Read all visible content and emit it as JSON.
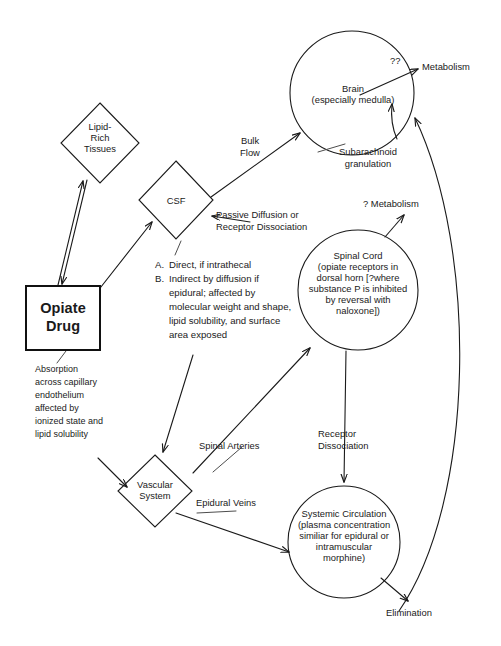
{
  "diagram": {
    "nodes": {
      "opiate_drug": {
        "line1": "Opiate",
        "line2": "Drug"
      },
      "lipid_rich": {
        "line1": "Lipid-",
        "line2": "Rich",
        "line3": "Tissues"
      },
      "csf": {
        "label": "CSF"
      },
      "vascular": {
        "line1": "Vascular",
        "line2": "System"
      },
      "brain": {
        "line1": "Brain",
        "line2": "(especially medulla)"
      },
      "spinal_cord": {
        "line1": "Spinal Cord",
        "line2": "(opiate receptors in",
        "line3": "dorsal horn [?where",
        "line4": "substance P is inhibited",
        "line5": "by reversal with",
        "line6": "naloxone])"
      },
      "systemic": {
        "line1": "Systemic Circulation",
        "line2": "(plasma concentration",
        "line3": "similiar for epidural or",
        "line4": "intramuscular",
        "line5": "morphine)"
      }
    },
    "terminals": {
      "metabolism_brain": "Metabolism",
      "metabolism_brain_query": "??",
      "metabolism_spinal": "? Metabolism",
      "elimination": "Elimination"
    },
    "edge_labels": {
      "bulk_flow": "Bulk\nFlow",
      "passive_diffusion": "Passive Diffusion or\nReceptor Dissociation",
      "subarachnoid": "Subarachnoid\ngranulation",
      "spinal_arteries": "Spinal Arteries",
      "epidural_veins": "Epidural Veins",
      "receptor_dissociation": "Receptor\nDissociation"
    },
    "notes": {
      "absorption": "Absorption\nacross capillary\nendothelium\naffected by\nionized state and\nlipid solubility",
      "route_list": [
        {
          "marker": "A.",
          "text": "Direct, if intrathecal"
        },
        {
          "marker": "B.",
          "text": "Indirect by diffusion if epidural; affected by molecular weight and shape, lipid solubility, and surface area exposed"
        }
      ]
    },
    "colors": {
      "stroke": "#1a1a1a",
      "leader": "#4d4d4d",
      "background": "#ffffff"
    }
  }
}
